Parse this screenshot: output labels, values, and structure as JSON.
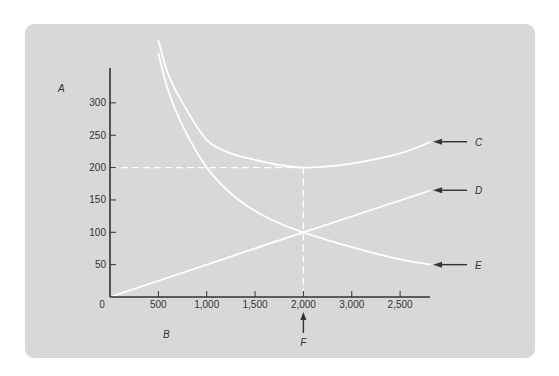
{
  "chart_data": {
    "type": "line",
    "title": "",
    "xlabel": "B",
    "ylabel": "A",
    "xlim": [
      0,
      3350
    ],
    "ylim": [
      0,
      360
    ],
    "grid": false,
    "x_ticks": [
      {
        "pos": 500,
        "label": "500"
      },
      {
        "pos": 1000,
        "label": "1,000"
      },
      {
        "pos": 1500,
        "label": "1,500"
      },
      {
        "pos": 2000,
        "label": "2,000"
      },
      {
        "pos": 2500,
        "label": "3,000"
      },
      {
        "pos": 3000,
        "label": "2,500"
      }
    ],
    "origin_label": "0",
    "y_ticks": [
      {
        "pos": 50,
        "label": "50"
      },
      {
        "pos": 100,
        "label": "100"
      },
      {
        "pos": 150,
        "label": "150"
      },
      {
        "pos": 200,
        "label": "200"
      },
      {
        "pos": 250,
        "label": "250"
      },
      {
        "pos": 300,
        "label": "300"
      }
    ],
    "series": [
      {
        "name": "C",
        "x": [
          500,
          600,
          750,
          1000,
          1250,
          1500,
          1750,
          2000,
          2250,
          2500,
          3000,
          3320
        ],
        "values": [
          397,
          345,
          300,
          243,
          222,
          212,
          204,
          200,
          202,
          206,
          222,
          240
        ]
      },
      {
        "name": "D",
        "x": [
          0,
          2000,
          3320
        ],
        "values": [
          0,
          100,
          165
        ]
      },
      {
        "name": "E",
        "x": [
          500,
          600,
          750,
          1000,
          1250,
          1500,
          1750,
          2000,
          2500,
          3000,
          3320
        ],
        "values": [
          377,
          320,
          265,
          200,
          160,
          133,
          114,
          100,
          77,
          58,
          50
        ]
      }
    ],
    "reference_lines": [
      {
        "type": "horizontal",
        "y": 200,
        "x_from": 0,
        "x_to": 2000,
        "style": "dashed"
      },
      {
        "type": "vertical",
        "x": 2000,
        "y_from": 0,
        "y_to": 200,
        "style": "dashed"
      }
    ],
    "annotations": [
      {
        "label": "C",
        "points_to": "C",
        "arrow": "left"
      },
      {
        "label": "D",
        "points_to": "D",
        "arrow": "left"
      },
      {
        "label": "E",
        "points_to": "E",
        "arrow": "left"
      },
      {
        "label": "F",
        "points_to": 2000,
        "arrow": "up"
      }
    ],
    "legend": "none",
    "line_color": "#ffffff",
    "background_color": "#d8d8d8",
    "axis_color": "#333333"
  }
}
